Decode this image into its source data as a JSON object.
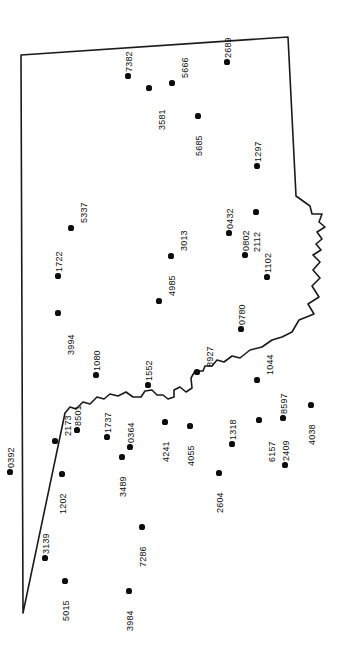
{
  "figure": {
    "kind": "point-location-map",
    "width": 362,
    "height": 650,
    "background_color": "#ffffff",
    "outline_color": "#1a1a1a",
    "point_color": "#0d0d0d",
    "label_color": "#0d0d0d",
    "label_orientation": "rotated-90-ccw",
    "title": "",
    "caption": "",
    "legend": ""
  },
  "chart_data": {
    "type": "scatter",
    "title": "",
    "xlabel": "",
    "ylabel": "",
    "xlim": [
      0,
      362
    ],
    "ylim": [
      650,
      0
    ],
    "grid": false,
    "legend": "none",
    "series": [
      {
        "name": "sites",
        "marker": "filled-circle",
        "color": "#0d0d0d",
        "points": [
          {
            "label": "7382",
            "x": 128,
            "y": 76,
            "side": "left"
          },
          {
            "label": "3581",
            "x": 149,
            "y": 88,
            "side": "right"
          },
          {
            "label": "5666",
            "x": 172,
            "y": 83,
            "side": "above"
          },
          {
            "label": "2689",
            "x": 227,
            "y": 62,
            "side": "left"
          },
          {
            "label": "5685",
            "x": 198,
            "y": 116,
            "side": "below"
          },
          {
            "label": "1297",
            "x": 257,
            "y": 166,
            "side": "left"
          },
          {
            "label": "5337",
            "x": 71,
            "y": 228,
            "side": "above"
          },
          {
            "label": "0432",
            "x": 229,
            "y": 233,
            "side": "left"
          },
          {
            "label": "2112",
            "x": 256,
            "y": 212,
            "side": "below"
          },
          {
            "label": "0802",
            "x": 245,
            "y": 255,
            "side": "left"
          },
          {
            "label": "3013",
            "x": 171,
            "y": 256,
            "side": "above"
          },
          {
            "label": "1102",
            "x": 267,
            "y": 277,
            "side": "left"
          },
          {
            "label": "1722",
            "x": 58,
            "y": 276,
            "side": "left"
          },
          {
            "label": "4985",
            "x": 159,
            "y": 301,
            "side": "above"
          },
          {
            "label": "0780",
            "x": 241,
            "y": 329,
            "side": "left"
          },
          {
            "label": "3994",
            "x": 58,
            "y": 313,
            "side": "right"
          },
          {
            "label": "8927",
            "x": 197,
            "y": 372,
            "side": "above"
          },
          {
            "label": "1080",
            "x": 96,
            "y": 375,
            "side": "left"
          },
          {
            "label": "1044",
            "x": 257,
            "y": 380,
            "side": "above"
          },
          {
            "label": "1552",
            "x": 148,
            "y": 385,
            "side": "left"
          },
          {
            "label": "2173",
            "x": 55,
            "y": 441,
            "side": "above"
          },
          {
            "label": "8501",
            "x": 77,
            "y": 430,
            "side": "left"
          },
          {
            "label": "1737",
            "x": 107,
            "y": 437,
            "side": "left"
          },
          {
            "label": "0364",
            "x": 130,
            "y": 447,
            "side": "left"
          },
          {
            "label": "4241",
            "x": 165,
            "y": 422,
            "side": "below"
          },
          {
            "label": "4055",
            "x": 190,
            "y": 426,
            "side": "below"
          },
          {
            "label": "6157",
            "x": 259,
            "y": 420,
            "side": "right"
          },
          {
            "label": "8597",
            "x": 283,
            "y": 418,
            "side": "left"
          },
          {
            "label": "4038",
            "x": 311,
            "y": 405,
            "side": "below"
          },
          {
            "label": "0392",
            "x": 10,
            "y": 472,
            "side": "left"
          },
          {
            "label": "1202",
            "x": 62,
            "y": 474,
            "side": "below"
          },
          {
            "label": "3489",
            "x": 122,
            "y": 457,
            "side": "below"
          },
          {
            "label": "1318",
            "x": 232,
            "y": 444,
            "side": "left"
          },
          {
            "label": "2604",
            "x": 219,
            "y": 473,
            "side": "below"
          },
          {
            "label": "2409",
            "x": 285,
            "y": 465,
            "side": "left"
          },
          {
            "label": "3139",
            "x": 45,
            "y": 558,
            "side": "left"
          },
          {
            "label": "5015",
            "x": 65,
            "y": 581,
            "side": "below"
          },
          {
            "label": "7286",
            "x": 142,
            "y": 527,
            "side": "below"
          },
          {
            "label": "3984",
            "x": 129,
            "y": 591,
            "side": "below"
          }
        ]
      }
    ],
    "boundary": {
      "name": "study-area-outline",
      "closed": true,
      "stroke": "#1a1a1a",
      "fill": "#ffffff"
    }
  }
}
